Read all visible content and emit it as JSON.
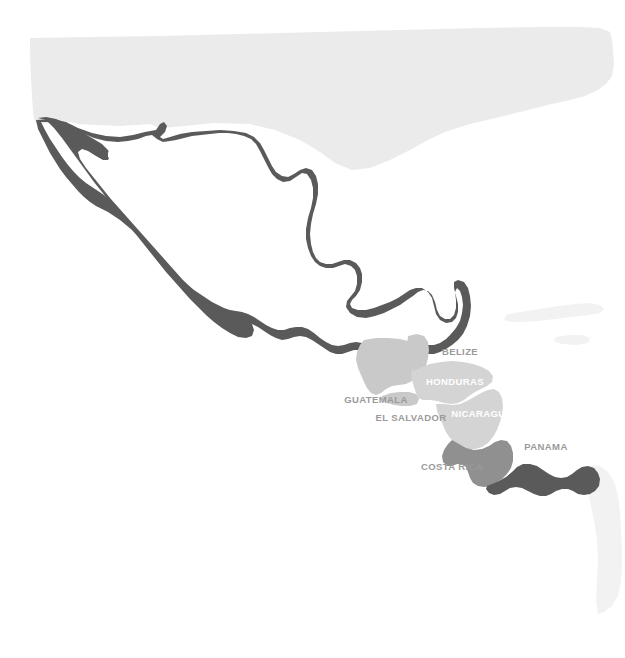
{
  "map": {
    "title": "Mexico and Central America",
    "background_color": "#ffffff",
    "projection_note": "",
    "colors": {
      "dark_fill": "#5a5a5a",
      "mid_fill": "#909090",
      "light_fill": "#c9c9c9",
      "lighter_fill": "#d9d9d9",
      "faint_fill": "#ebebeb",
      "very_faint_fill": "#f2f2f2",
      "label_on_dark": "#ffffff",
      "label_on_light": "#ffffff",
      "label_outside": "#9a9a9a"
    },
    "regions": [
      {
        "id": "united-states",
        "name": "United States",
        "label": "",
        "fill": "#ebebeb",
        "labelled": false
      },
      {
        "id": "mexico",
        "name": "Mexico",
        "label": "MEXICO",
        "fill": "#5a5a5a",
        "label_color": "#ffffff",
        "label_x": 250,
        "label_y": 264,
        "label_size": 10,
        "labelled": true
      },
      {
        "id": "belize",
        "name": "Belize",
        "label": "BELIZE",
        "fill": "#c9c9c9",
        "label_color": "#9a9a9a",
        "label_x": 460,
        "label_y": 355,
        "label_size": 9.5,
        "labelled": true
      },
      {
        "id": "guatemala",
        "name": "Guatemala",
        "label": "GUATEMALA",
        "fill": "#c9c9c9",
        "label_color": "#9a9a9a",
        "label_x": 376,
        "label_y": 403,
        "label_size": 9.5,
        "labelled": true
      },
      {
        "id": "honduras",
        "name": "Honduras",
        "label": "HONDURAS",
        "fill": "#d4d4d4",
        "label_color": "#ffffff",
        "label_x": 455,
        "label_y": 385,
        "label_size": 9.5,
        "labelled": true
      },
      {
        "id": "el-salvador",
        "name": "El Salvador",
        "label": "EL SALVADOR",
        "fill": "#c9c9c9",
        "label_color": "#9a9a9a",
        "label_x": 411,
        "label_y": 421,
        "label_size": 9.5,
        "labelled": true
      },
      {
        "id": "nicaragua",
        "name": "Nicaragua",
        "label": "NICARAGUA",
        "fill": "#d4d4d4",
        "label_color": "#ffffff",
        "label_x": 482,
        "label_y": 417,
        "label_size": 9.5,
        "labelled": true
      },
      {
        "id": "costa-rica",
        "name": "Costa Rica",
        "label": "COSTA RICA",
        "fill": "#909090",
        "label_color": "#9a9a9a",
        "label_x": 452,
        "label_y": 470,
        "label_size": 9.5,
        "labelled": true
      },
      {
        "id": "panama",
        "name": "Panama",
        "label": "PANAMA",
        "fill": "#5a5a5a",
        "label_color": "#9a9a9a",
        "label_x": 546,
        "label_y": 450,
        "label_size": 9.5,
        "labelled": true
      },
      {
        "id": "cuba",
        "name": "Cuba",
        "label": "",
        "fill": "#f2f2f2",
        "labelled": false
      },
      {
        "id": "jamaica",
        "name": "Jamaica",
        "label": "",
        "fill": "#f2f2f2",
        "labelled": false
      },
      {
        "id": "colombia",
        "name": "Colombia",
        "label": "",
        "fill": "#f2f2f2",
        "labelled": false
      }
    ]
  }
}
